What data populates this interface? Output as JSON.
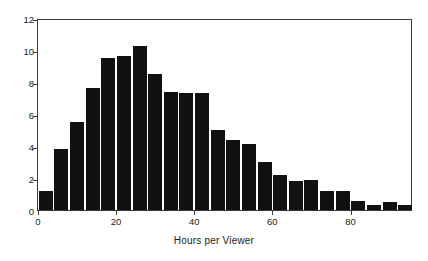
{
  "chart_data": {
    "type": "bar",
    "title": "",
    "subtitle": "",
    "xlabel": "Hours per Viewer",
    "ylabel": "",
    "xlim": [
      0,
      96
    ],
    "ylim": [
      0,
      12
    ],
    "bin_width": 4,
    "grid": false,
    "legend": null,
    "bar_color": "#111111",
    "axis_color": "#3a3a3a",
    "x_ticks": [
      0,
      20,
      40,
      60,
      80
    ],
    "x_tick_labels": [
      "0",
      "20",
      "40",
      "60",
      "80"
    ],
    "y_ticks": [
      0,
      2,
      4,
      6,
      8,
      10,
      12
    ],
    "y_tick_labels": [
      "0",
      "2",
      "4",
      "6",
      "8",
      "10",
      "12"
    ],
    "categories": [
      0,
      4,
      8,
      12,
      16,
      20,
      24,
      28,
      32,
      36,
      40,
      44,
      48,
      52,
      56,
      60,
      64,
      68,
      72,
      76,
      80,
      84,
      88,
      92
    ],
    "values": [
      1.2,
      3.8,
      5.5,
      7.6,
      9.5,
      9.6,
      10.25,
      8.5,
      7.4,
      7.3,
      7.3,
      5.0,
      4.4,
      4.1,
      3.0,
      2.2,
      1.8,
      1.9,
      1.2,
      1.2,
      0.55,
      0.3,
      0.5,
      0.3
    ]
  }
}
